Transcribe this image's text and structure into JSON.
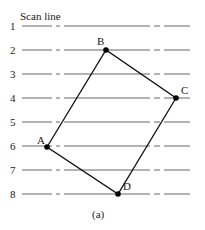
{
  "title": "Scan line",
  "caption": "(a)",
  "scan_lines": [
    {
      "label": "1",
      "y": 26
    },
    {
      "label": "2",
      "y": 50
    },
    {
      "label": "3",
      "y": 74
    },
    {
      "label": "4",
      "y": 98
    },
    {
      "label": "5",
      "y": 122
    },
    {
      "label": "6",
      "y": 146
    },
    {
      "label": "7",
      "y": 170
    },
    {
      "label": "8",
      "y": 194
    }
  ],
  "vertices": [
    {
      "label": "A",
      "x": 47,
      "y": 147
    },
    {
      "label": "B",
      "x": 106,
      "y": 50
    },
    {
      "label": "C",
      "x": 176,
      "y": 98
    },
    {
      "label": "D",
      "x": 118,
      "y": 194
    }
  ],
  "colors": {
    "line": "#555555",
    "polygon": "#111111"
  }
}
